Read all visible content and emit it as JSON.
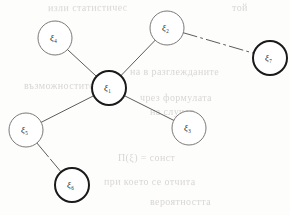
{
  "figure": {
    "type": "graph-diagram",
    "background_color": "#fdfdfc",
    "stroke_color": "#4a4a4a",
    "bold_stroke_color": "#1a1a1a",
    "label_color": "#2a2a2a"
  },
  "chart_data": {
    "type": "diagram",
    "title": "",
    "nodes": [
      {
        "id": "n1",
        "symbol": "ξ",
        "subscript": "1",
        "label": "ξ1",
        "cx": 109,
        "cy": 88,
        "r": 17,
        "emphasis": "bold",
        "stroke_width": 2.0,
        "stroke": "#1a1a1a",
        "degree": 4
      },
      {
        "id": "n2",
        "symbol": "ξ",
        "subscript": "2",
        "label": "ξ2",
        "cx": 167,
        "cy": 28,
        "r": 17,
        "emphasis": "thin",
        "stroke_width": 0.9,
        "stroke": "#6d6a66",
        "degree": 2
      },
      {
        "id": "n3",
        "symbol": "ξ",
        "subscript": "3",
        "label": "ξ3",
        "cx": 189,
        "cy": 128,
        "r": 17,
        "emphasis": "thin",
        "stroke_width": 0.9,
        "stroke": "#6d6a66",
        "degree": 1
      },
      {
        "id": "n4",
        "symbol": "ξ",
        "subscript": "4",
        "label": "ξ4",
        "cx": 55,
        "cy": 38,
        "r": 17,
        "emphasis": "thin",
        "stroke_width": 0.9,
        "stroke": "#6d6a66",
        "degree": 1
      },
      {
        "id": "n5",
        "symbol": "ξ",
        "subscript": "5",
        "label": "ξ5",
        "cx": 26,
        "cy": 130,
        "r": 17,
        "emphasis": "thin",
        "stroke_width": 0.9,
        "stroke": "#6d6a66",
        "degree": 2
      },
      {
        "id": "n6",
        "symbol": "ξ",
        "subscript": "6",
        "label": "ξ6",
        "cx": 72,
        "cy": 185,
        "r": 17,
        "emphasis": "bold",
        "stroke_width": 2.0,
        "stroke": "#1a1a1a",
        "degree": 1
      },
      {
        "id": "n7",
        "symbol": "ξ",
        "subscript": "7",
        "label": "ξ7",
        "cx": 270,
        "cy": 58,
        "r": 17,
        "emphasis": "bold",
        "stroke_width": 2.0,
        "stroke": "#1a1a1a",
        "degree": 1
      }
    ],
    "edges": [
      {
        "id": "e14",
        "from": "n1",
        "to": "n4",
        "style": "solid",
        "stroke_width": 0.9
      },
      {
        "id": "e12",
        "from": "n1",
        "to": "n2",
        "style": "solid",
        "stroke_width": 0.9
      },
      {
        "id": "e13",
        "from": "n1",
        "to": "n3",
        "style": "solid",
        "stroke_width": 0.9
      },
      {
        "id": "e15",
        "from": "n1",
        "to": "n5",
        "style": "solid",
        "stroke_width": 0.9
      },
      {
        "id": "e27",
        "from": "n2",
        "to": "n7",
        "style": "dashed",
        "stroke_width": 0.9,
        "dash_pattern": "14 4 2 4"
      },
      {
        "id": "e56",
        "from": "n5",
        "to": "n6",
        "style": "broken",
        "stroke_width": 0.9,
        "dash_pattern": "18 3"
      }
    ],
    "legend": [],
    "annotations": []
  },
  "ghosts": [
    {
      "id": "g1",
      "text": "изли статистичес",
      "x": 48,
      "y": 2,
      "size": 10,
      "rotate": -0.4
    },
    {
      "id": "g2",
      "text": "той",
      "x": 232,
      "y": 2,
      "size": 10,
      "rotate": -0.3
    },
    {
      "id": "g3",
      "text": "на в разглежданите",
      "x": 130,
      "y": 66,
      "size": 10,
      "rotate": 0.2
    },
    {
      "id": "g4",
      "text": "възможностите",
      "x": 24,
      "y": 80,
      "size": 10,
      "rotate": 0.1
    },
    {
      "id": "g5",
      "text": "чрез формулата",
      "x": 140,
      "y": 92,
      "size": 10,
      "rotate": 0.2
    },
    {
      "id": "g6",
      "text": "на случая",
      "x": 150,
      "y": 106,
      "size": 10,
      "rotate": 0.0
    },
    {
      "id": "g7",
      "text": "П(ξ) = сонст",
      "x": 118,
      "y": 152,
      "size": 10,
      "rotate": 0.1
    },
    {
      "id": "g8",
      "text": "при което се отчита",
      "x": 104,
      "y": 176,
      "size": 10,
      "rotate": 0.2
    },
    {
      "id": "g9",
      "text": "вероятността",
      "x": 150,
      "y": 196,
      "size": 10,
      "rotate": 0.1
    }
  ]
}
